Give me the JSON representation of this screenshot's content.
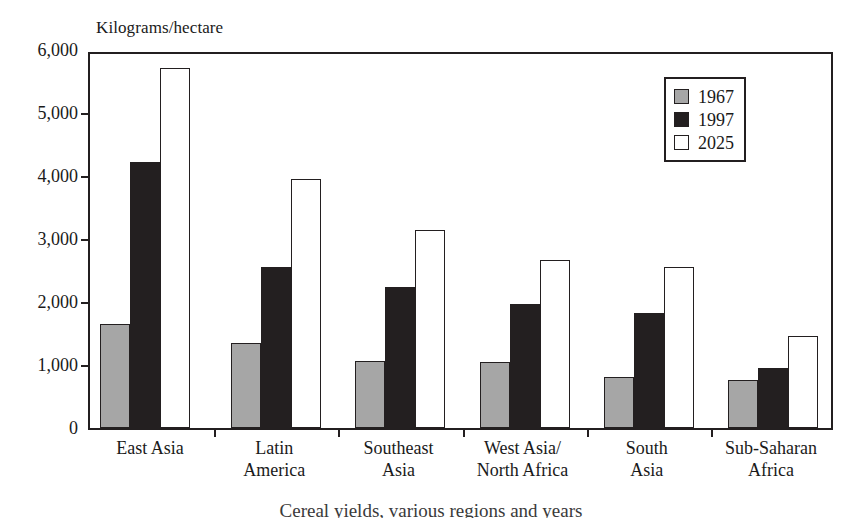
{
  "chart_data": {
    "type": "bar",
    "title": "",
    "axis_title": "Kilograms/hectare",
    "xlabel": "",
    "ylabel": "Kilograms/hectare",
    "ylim": [
      0,
      6000
    ],
    "yticks": [
      0,
      1000,
      2000,
      3000,
      4000,
      5000,
      6000
    ],
    "ytick_labels": [
      "0",
      "1,000",
      "2,000",
      "3,000",
      "4,000",
      "5,000",
      "6,000"
    ],
    "grid": false,
    "legend_position": "top-right",
    "categories": [
      "East Asia",
      "Latin\nAmerica",
      "Southeast\nAsia",
      "West Asia/\nNorth Africa",
      "South\nAsia",
      "Sub-Saharan\nAfrica"
    ],
    "series": [
      {
        "name": "1967",
        "color": "#a6a6a6",
        "values": [
          1650,
          1350,
          1060,
          1050,
          810,
          760
        ]
      },
      {
        "name": "1997",
        "color": "#231f20",
        "values": [
          4220,
          2550,
          2240,
          1970,
          1820,
          960
        ]
      },
      {
        "name": "2025",
        "color": "#ffffff",
        "values": [
          5710,
          3950,
          3150,
          2670,
          2560,
          1460
        ]
      }
    ],
    "caption": "Cereal yields, various regions and years"
  },
  "legend": {
    "entries": [
      {
        "label": "1967",
        "swatch": "gray"
      },
      {
        "label": "1997",
        "swatch": "black"
      },
      {
        "label": "2025",
        "swatch": "white"
      }
    ]
  }
}
